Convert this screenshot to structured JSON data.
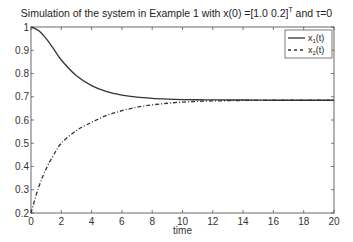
{
  "chart_data": {
    "type": "line",
    "title": "Simulation of the system in Example 1 with x(0) =[1.0   0.2]",
    "title_superscript": "T",
    "title_suffix": " and τ=0",
    "xlabel": "time",
    "ylabel": "",
    "xlim": [
      0,
      20
    ],
    "ylim": [
      0.2,
      1.0
    ],
    "xticks": [
      0,
      2,
      4,
      6,
      8,
      10,
      12,
      14,
      16,
      18,
      20
    ],
    "yticks": [
      0.2,
      0.3,
      0.4,
      0.5,
      0.6,
      0.7,
      0.8,
      0.9,
      1
    ],
    "ytick_labels": [
      "0.2",
      "0.3",
      "0.4",
      "0.5",
      "0.6",
      "0.7",
      "0.8",
      "0.9",
      "1"
    ],
    "grid": false,
    "legend_position": "upper right",
    "x": [
      0,
      0.5,
      1,
      1.5,
      2,
      3,
      4,
      5,
      6,
      7,
      8,
      9,
      10,
      11,
      12,
      13,
      14,
      16,
      18,
      20
    ],
    "series": [
      {
        "name": "x1(t)",
        "legend_main": "x",
        "legend_sub": "1",
        "legend_suffix": "(t)",
        "style": "solid",
        "color": "#333333",
        "values": [
          1.0,
          0.985,
          0.95,
          0.905,
          0.858,
          0.79,
          0.748,
          0.722,
          0.707,
          0.698,
          0.693,
          0.69,
          0.688,
          0.687,
          0.6865,
          0.686,
          0.686,
          0.685,
          0.685,
          0.685
        ]
      },
      {
        "name": "x2(t)",
        "legend_main": "x",
        "legend_sub": "2",
        "legend_suffix": "(t)",
        "style": "dashdot",
        "color": "#333333",
        "values": [
          0.2,
          0.31,
          0.39,
          0.45,
          0.5,
          0.555,
          0.59,
          0.62,
          0.64,
          0.655,
          0.665,
          0.672,
          0.677,
          0.68,
          0.682,
          0.683,
          0.684,
          0.685,
          0.685,
          0.685
        ]
      }
    ]
  }
}
